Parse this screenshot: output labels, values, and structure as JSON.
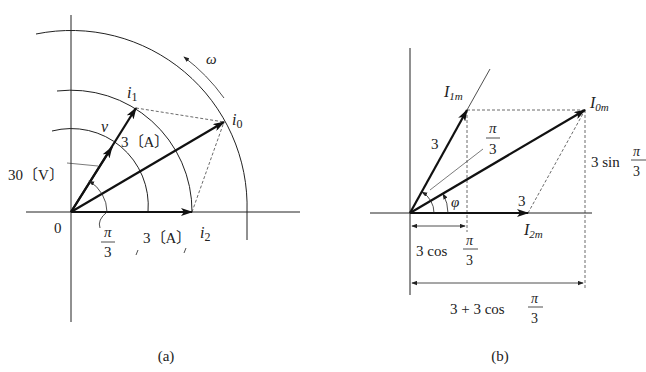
{
  "figure_a": {
    "caption": "(a)",
    "origin_label": "0",
    "omega_label": "ω",
    "vectors": {
      "i1": {
        "label": "i",
        "sub": "1",
        "magnitude_label": "3〔A〕"
      },
      "i0": {
        "label": "i",
        "sub": "0"
      },
      "i2": {
        "label": "i",
        "sub": "2",
        "magnitude_label": "3〔A〕"
      },
      "v": {
        "label": "v",
        "magnitude_label": "30〔V〕"
      }
    },
    "angle": {
      "numerator": "π",
      "denominator": "3"
    }
  },
  "figure_b": {
    "caption": "(b)",
    "vectors": {
      "I1m": {
        "label": "I",
        "sub": "1m",
        "magnitude_label": "3"
      },
      "I0m": {
        "label": "I",
        "sub": "0m"
      },
      "I2m": {
        "label": "I",
        "sub": "2m",
        "magnitude_label": "3"
      }
    },
    "angle_pi3": {
      "numerator": "π",
      "denominator": "3"
    },
    "phi_label": "φ",
    "vertical_component": {
      "prefix": "3 sin",
      "numerator": "π",
      "denominator": "3"
    },
    "short_horizontal": {
      "prefix": "3 cos",
      "numerator": "π",
      "denominator": "3"
    },
    "long_horizontal": {
      "prefix": "3 + 3 cos",
      "numerator": "π",
      "denominator": "3"
    }
  },
  "colors": {
    "ink": "#222222",
    "background": "#ffffff"
  }
}
